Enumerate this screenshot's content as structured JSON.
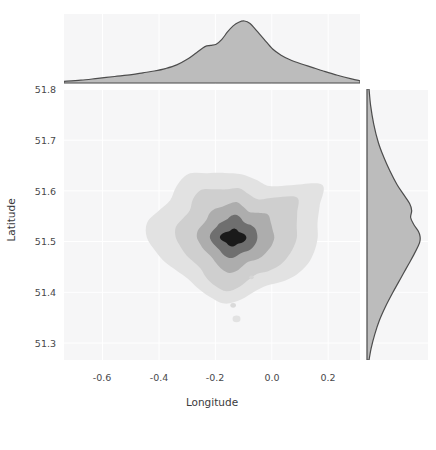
{
  "figure": {
    "kind": "joint-kde-plot",
    "background": "#ffffff",
    "panel_background": "#f6f6f7",
    "gridline_color": "#ffffff",
    "line_color": "#4d4d4d",
    "marginal_fill": "#b8b8b8"
  },
  "axes": {
    "xlabel": "Longitude",
    "ylabel": "Latitude",
    "xticks": [
      "-0.6",
      "-0.4",
      "-0.2",
      "0.0",
      "0.2"
    ],
    "yticks": [
      "51.8",
      "51.7",
      "51.6",
      "51.5",
      "51.4",
      "51.3"
    ]
  },
  "chart_data": {
    "type": "heatmap",
    "subtype": "bivariate-kde-contour-with-marginals",
    "title": "",
    "xlabel": "Longitude",
    "ylabel": "Latitude",
    "xlim": [
      -0.72,
      0.33
    ],
    "ylim": [
      51.255,
      51.835
    ],
    "xticks": [
      -0.6,
      -0.4,
      -0.2,
      0.0,
      0.2
    ],
    "yticks": [
      51.3,
      51.4,
      51.5,
      51.6,
      51.7,
      51.8
    ],
    "grid": true,
    "legend": null,
    "contour_levels": [
      {
        "level": 1,
        "label": "outermost",
        "fill": "#e2e2e2",
        "density": 0.2
      },
      {
        "level": 2,
        "label": "outer",
        "fill": "#cfcfcf",
        "density": 0.4
      },
      {
        "level": 3,
        "label": "mid",
        "fill": "#adadad",
        "density": 0.6
      },
      {
        "level": 4,
        "label": "inner",
        "fill": "#6f6f6f",
        "density": 0.8
      },
      {
        "level": 5,
        "label": "core",
        "fill": "#1a1a1a",
        "density": 1.0
      }
    ],
    "density_peak": {
      "longitude": -0.12,
      "latitude": 51.517
    },
    "marginal_x": {
      "axis": "longitude",
      "label": "Longitude",
      "peak": -0.1,
      "shoulder": -0.21,
      "x": [
        -0.72,
        -0.66,
        -0.6,
        -0.54,
        -0.48,
        -0.44,
        -0.4,
        -0.36,
        -0.32,
        -0.28,
        -0.25,
        -0.22,
        -0.2,
        -0.18,
        -0.16,
        -0.14,
        -0.12,
        -0.1,
        -0.08,
        -0.06,
        -0.04,
        -0.01,
        0.02,
        0.05,
        0.08,
        0.12,
        0.16,
        0.2,
        0.25,
        0.3,
        0.33
      ],
      "y": [
        0.01,
        0.03,
        0.06,
        0.09,
        0.12,
        0.15,
        0.18,
        0.22,
        0.28,
        0.38,
        0.48,
        0.58,
        0.6,
        0.62,
        0.7,
        0.82,
        0.92,
        0.98,
        1.0,
        0.96,
        0.86,
        0.7,
        0.54,
        0.44,
        0.37,
        0.3,
        0.24,
        0.18,
        0.11,
        0.05,
        0.02
      ]
    },
    "marginal_y": {
      "axis": "latitude",
      "label": "Latitude",
      "peak": 51.515,
      "shoulder": 51.565,
      "y": [
        51.255,
        51.28,
        51.31,
        51.34,
        51.37,
        51.4,
        51.42,
        51.44,
        51.46,
        51.48,
        51.5,
        51.51,
        51.52,
        51.53,
        51.545,
        51.56,
        51.575,
        51.59,
        51.61,
        51.63,
        51.66,
        51.69,
        51.72,
        51.76,
        51.8,
        51.835
      ],
      "x": [
        0.02,
        0.06,
        0.13,
        0.22,
        0.34,
        0.48,
        0.58,
        0.68,
        0.78,
        0.88,
        0.97,
        1.0,
        1.0,
        0.97,
        0.88,
        0.82,
        0.84,
        0.8,
        0.68,
        0.56,
        0.42,
        0.3,
        0.2,
        0.11,
        0.05,
        0.02
      ]
    }
  }
}
